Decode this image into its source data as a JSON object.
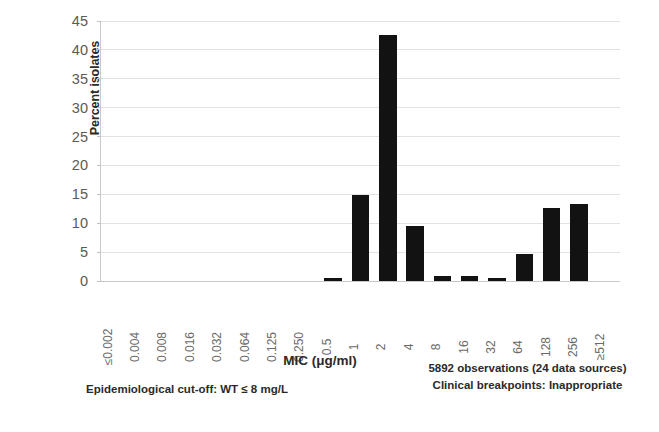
{
  "chart_data": {
    "type": "bar",
    "title": "",
    "xlabel": "MIC (μg/ml)",
    "ylabel": "Percent isolates",
    "ylim": [
      0,
      45
    ],
    "yticks": [
      0,
      5,
      10,
      15,
      20,
      25,
      30,
      35,
      40,
      45
    ],
    "grid": true,
    "legend": false,
    "categories": [
      "≤0.002",
      "0.004",
      "0.008",
      "0.016",
      "0.032",
      "0.064",
      "0.125",
      "0.250",
      "0.5",
      "1",
      "2",
      "4",
      "8",
      "16",
      "32",
      "64",
      "128",
      "256",
      "≥512"
    ],
    "values": [
      0,
      0,
      0,
      0,
      0,
      0,
      0,
      0,
      0.6,
      14.9,
      42.6,
      9.6,
      0.9,
      0.8,
      0.6,
      4.7,
      12.7,
      13.4,
      0
    ],
    "bar_color": "#121212",
    "annotations": [
      "5892 observations (24 data sources)",
      "Clinical breakpoints: Inappropriate",
      "Epidemiological cut-off:  WT ≤ 8 mg/L"
    ]
  },
  "axes": {
    "y_title": "Percent isolates",
    "x_title": "MIC (μg/ml)",
    "y_tick_labels": [
      "45",
      "40",
      "35",
      "30",
      "25",
      "20",
      "15",
      "10",
      "5",
      "0"
    ]
  },
  "footnotes": {
    "observations": "5892 observations (24 data sources)",
    "breakpoints": "Clinical breakpoints: Inappropriate",
    "cutoff": "Epidemiological cut-off:  WT ≤ 8 mg/L"
  }
}
